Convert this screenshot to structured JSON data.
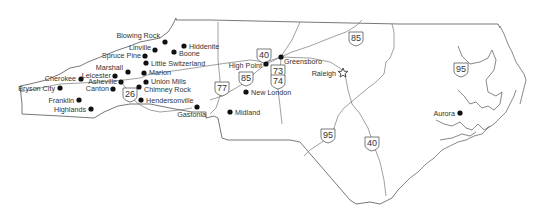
{
  "map": {
    "title": "North Carolina",
    "colors": {
      "border": "#555555",
      "road": "#777777",
      "dot": "#111111",
      "label": "#333333"
    },
    "cities": [
      {
        "name": "Blowing Rock",
        "x": 165,
        "y": 42,
        "lx": 160,
        "ly": 38,
        "anchor": "end"
      },
      {
        "name": "Linville",
        "x": 155,
        "y": 50,
        "lx": 151,
        "ly": 50,
        "anchor": "end"
      },
      {
        "name": "Hiddenite",
        "x": 184,
        "y": 46,
        "lx": 189,
        "ly": 49,
        "anchor": "start"
      },
      {
        "name": "Boone",
        "x": 174,
        "y": 52,
        "lx": 179,
        "ly": 56,
        "anchor": "start"
      },
      {
        "name": "Spruce Pine",
        "x": 145,
        "y": 56,
        "lx": 141,
        "ly": 58,
        "anchor": "end"
      },
      {
        "name": "Little Switzerland",
        "x": 146,
        "y": 63,
        "lx": 151,
        "ly": 66,
        "anchor": "start"
      },
      {
        "name": "Marshall",
        "x": 128,
        "y": 72,
        "lx": 123,
        "ly": 70,
        "anchor": "end"
      },
      {
        "name": "Marion",
        "x": 144,
        "y": 73,
        "lx": 149,
        "ly": 75,
        "anchor": "start"
      },
      {
        "name": "Leicester",
        "x": 115,
        "y": 76,
        "lx": 111,
        "ly": 78,
        "anchor": "end"
      },
      {
        "name": "Asheville",
        "x": 121,
        "y": 82,
        "lx": 117,
        "ly": 84,
        "anchor": "end"
      },
      {
        "name": "Union Mills",
        "x": 146,
        "y": 82,
        "lx": 151,
        "ly": 84,
        "anchor": "start"
      },
      {
        "name": "Cherokee",
        "x": 81,
        "y": 79,
        "lx": 76,
        "ly": 81,
        "anchor": "end"
      },
      {
        "name": "Canton",
        "x": 113,
        "y": 89,
        "lx": 109,
        "ly": 91,
        "anchor": "end"
      },
      {
        "name": "Chimney Rock",
        "x": 139,
        "y": 87,
        "lx": 144,
        "ly": 92,
        "anchor": "start"
      },
      {
        "name": "Bryson City",
        "x": 60,
        "y": 88,
        "lx": 55,
        "ly": 91,
        "anchor": "end"
      },
      {
        "name": "Franklin",
        "x": 79,
        "y": 100,
        "lx": 74,
        "ly": 103,
        "anchor": "end"
      },
      {
        "name": "Hendersonville",
        "x": 141,
        "y": 100,
        "lx": 146,
        "ly": 103,
        "anchor": "start"
      },
      {
        "name": "Highlands",
        "x": 91,
        "y": 109,
        "lx": 86,
        "ly": 112,
        "anchor": "end"
      },
      {
        "name": "Gastonia",
        "x": 197,
        "y": 107,
        "lx": 206,
        "ly": 117,
        "anchor": "end"
      },
      {
        "name": "Greensboro",
        "x": 281,
        "y": 57,
        "lx": 284,
        "ly": 64,
        "anchor": "start"
      },
      {
        "name": "High Point",
        "x": 266,
        "y": 64,
        "lx": 262,
        "ly": 68,
        "anchor": "end"
      },
      {
        "name": "New London",
        "x": 246,
        "y": 92,
        "lx": 251,
        "ly": 95,
        "anchor": "start"
      },
      {
        "name": "Midland",
        "x": 230,
        "y": 112,
        "lx": 235,
        "ly": 115,
        "anchor": "start"
      },
      {
        "name": "Aurora",
        "x": 460,
        "y": 113,
        "lx": 455,
        "ly": 116,
        "anchor": "end"
      }
    ],
    "capital": {
      "name": "Raleigh",
      "x": 343,
      "y": 73,
      "lx": 336,
      "ly": 76,
      "anchor": "end"
    },
    "shields": [
      {
        "number": "40",
        "x": 264,
        "y": 55
      },
      {
        "number": "85",
        "x": 356,
        "y": 38
      },
      {
        "number": "73",
        "x": 278,
        "y": 71
      },
      {
        "number": "74",
        "x": 278,
        "y": 81
      },
      {
        "number": "85",
        "x": 246,
        "y": 78
      },
      {
        "number": "77",
        "x": 222,
        "y": 88
      },
      {
        "number": "26",
        "x": 130,
        "y": 94
      },
      {
        "number": "95",
        "x": 461,
        "y": 69
      },
      {
        "number": "95",
        "x": 328,
        "y": 135
      },
      {
        "number": "40",
        "x": 372,
        "y": 143
      }
    ]
  }
}
